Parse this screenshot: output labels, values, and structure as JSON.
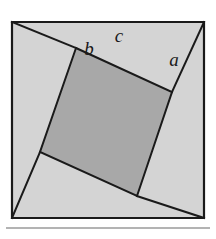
{
  "figure": {
    "background_color": "#ffffff",
    "outer_square": {
      "name": "outer-square",
      "fill_color": "#d4d4d4",
      "stroke_color": "#1a1a1a",
      "stroke_width": 2.2,
      "points": "12,22 204,22 204,218 12,218"
    },
    "inner_square": {
      "name": "inner-tilted-square",
      "fill_color": "#a8a8a8",
      "stroke_color": "#1a1a1a",
      "stroke_width": 2.0,
      "points": "76,48 172,92 137,196 40,152"
    },
    "triangle_legs": [
      {
        "name": "leg-top-left",
        "from": "12,22",
        "to": "76,48",
        "stroke_color": "#1a1a1a",
        "stroke_width": 2.0
      },
      {
        "name": "leg-top-right",
        "from": "204,22",
        "to": "172,92",
        "stroke_color": "#1a1a1a",
        "stroke_width": 2.0
      },
      {
        "name": "leg-bottom-right",
        "from": "204,218",
        "to": "137,196",
        "stroke_color": "#1a1a1a",
        "stroke_width": 2.0
      },
      {
        "name": "leg-bottom-left",
        "from": "12,218",
        "to": "40,152",
        "stroke_color": "#1a1a1a",
        "stroke_width": 2.0
      }
    ],
    "labels": [
      {
        "name": "label-b",
        "text": "b",
        "x": 89,
        "y": 55
      },
      {
        "name": "label-c",
        "text": "c",
        "x": 119,
        "y": 42
      },
      {
        "name": "label-a",
        "text": "a",
        "x": 174,
        "y": 66
      }
    ],
    "caption_rule": {
      "name": "caption-divider",
      "color": "#9a9a9a",
      "y": 228
    }
  }
}
